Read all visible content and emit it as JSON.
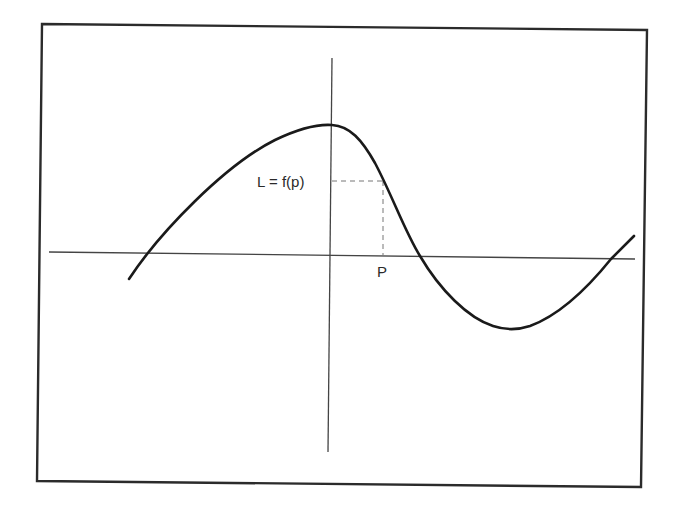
{
  "diagram": {
    "type": "function-curve",
    "colors": {
      "background": "#ffffff",
      "frame": "#2b2b2b",
      "axes": "#444444",
      "curve": "#1a1a1a",
      "guides": "#777777",
      "text": "#2a2a2a"
    },
    "frame": {
      "points": [
        [
          42,
          24
        ],
        [
          647,
          30
        ],
        [
          641,
          487
        ],
        [
          37,
          481
        ]
      ]
    },
    "x_axis": {
      "x1": 49,
      "y1": 252,
      "x2": 635,
      "y2": 259
    },
    "y_axis": {
      "x1": 332,
      "y1": 58,
      "x2": 328,
      "y2": 452
    },
    "curve": {
      "description": "Smooth S-shaped function: rises from lower-left, peaks at the y-axis, falls through the x-axis to a trough, then rises past the x-axis on the right",
      "path": "M129,279 C160,232 225,165 275,140 C300,128 318,124 332,125 C350,126 362,140 375,163 C392,195 405,232 420,256 C440,290 468,318 493,326 C505,330 518,330 530,326 C560,315 590,285 611,259 L634,236",
      "key_points": {
        "start": [
          129,
          279
        ],
        "left_root": [
          148,
          253
        ],
        "maximum": [
          332,
          125
        ],
        "point_on_curve_at_P": [
          383,
          181
        ],
        "middle_root": [
          420,
          256
        ],
        "minimum": [
          512,
          329
        ],
        "right_root": [
          611,
          259
        ],
        "end": [
          634,
          236
        ]
      }
    },
    "guides": {
      "horizontal": {
        "x1": 332,
        "y1": 181,
        "x2": 383,
        "y2": 181,
        "style": "dashed"
      },
      "vertical": {
        "x1": 383,
        "y1": 181,
        "x2": 383,
        "y2": 255,
        "style": "dashed"
      }
    },
    "labels": {
      "function_value": "L = f(p)",
      "point": "P"
    }
  }
}
